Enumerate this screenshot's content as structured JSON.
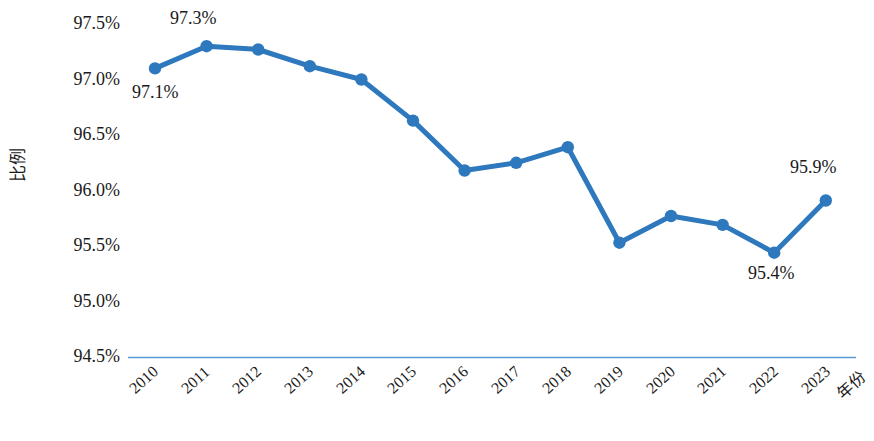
{
  "chart_data": {
    "type": "line",
    "title": "",
    "xlabel": "年份",
    "ylabel": "比例",
    "categories": [
      "2010",
      "2011",
      "2012",
      "2013",
      "2014",
      "2015",
      "2016",
      "2017",
      "2018",
      "2019",
      "2020",
      "2021",
      "2022",
      "2023"
    ],
    "values": [
      97.1,
      97.3,
      97.27,
      97.12,
      97.0,
      96.63,
      96.18,
      96.25,
      96.39,
      95.53,
      95.77,
      95.69,
      95.44,
      95.91
    ],
    "series": [
      {
        "name": "比例",
        "values": [
          97.1,
          97.3,
          97.27,
          97.12,
          97.0,
          96.63,
          96.18,
          96.25,
          96.39,
          95.53,
          95.77,
          95.69,
          95.44,
          95.91
        ]
      }
    ],
    "ylim": [
      94.5,
      97.5
    ],
    "ytick_labels": [
      "97.5%",
      "97.0%",
      "96.5%",
      "96.0%",
      "95.5%",
      "95.0%",
      "94.5%"
    ],
    "ytick_values": [
      97.5,
      97.0,
      96.5,
      96.0,
      95.5,
      95.0,
      94.5
    ],
    "grid": false,
    "legend": "none",
    "line_color": "#2E78BE",
    "marker_color": "#2E78BE",
    "axis_color": "#5B9BD5",
    "annotations": [
      {
        "label": "97.1%",
        "category": "2010",
        "value": 97.1
      },
      {
        "label": "97.3%",
        "category": "2011",
        "value": 97.3
      },
      {
        "label": "95.4%",
        "category": "2022",
        "value": 95.44
      },
      {
        "label": "95.9%",
        "category": "2023",
        "value": 95.91
      }
    ]
  },
  "axes": {
    "y_title": "比例",
    "x_title": "年份"
  },
  "y_ticks": [
    {
      "label": "97.5%"
    },
    {
      "label": "97.0%"
    },
    {
      "label": "96.5%"
    },
    {
      "label": "96.0%"
    },
    {
      "label": "95.5%"
    },
    {
      "label": "95.0%"
    },
    {
      "label": "94.5%"
    }
  ],
  "x_ticks": [
    {
      "label": "2010"
    },
    {
      "label": "2011"
    },
    {
      "label": "2012"
    },
    {
      "label": "2013"
    },
    {
      "label": "2014"
    },
    {
      "label": "2015"
    },
    {
      "label": "2016"
    },
    {
      "label": "2017"
    },
    {
      "label": "2018"
    },
    {
      "label": "2019"
    },
    {
      "label": "2020"
    },
    {
      "label": "2021"
    },
    {
      "label": "2022"
    },
    {
      "label": "2023"
    }
  ],
  "data_labels": [
    {
      "text": "97.1%"
    },
    {
      "text": "97.3%"
    },
    {
      "text": "95.4%"
    },
    {
      "text": "95.9%"
    }
  ]
}
